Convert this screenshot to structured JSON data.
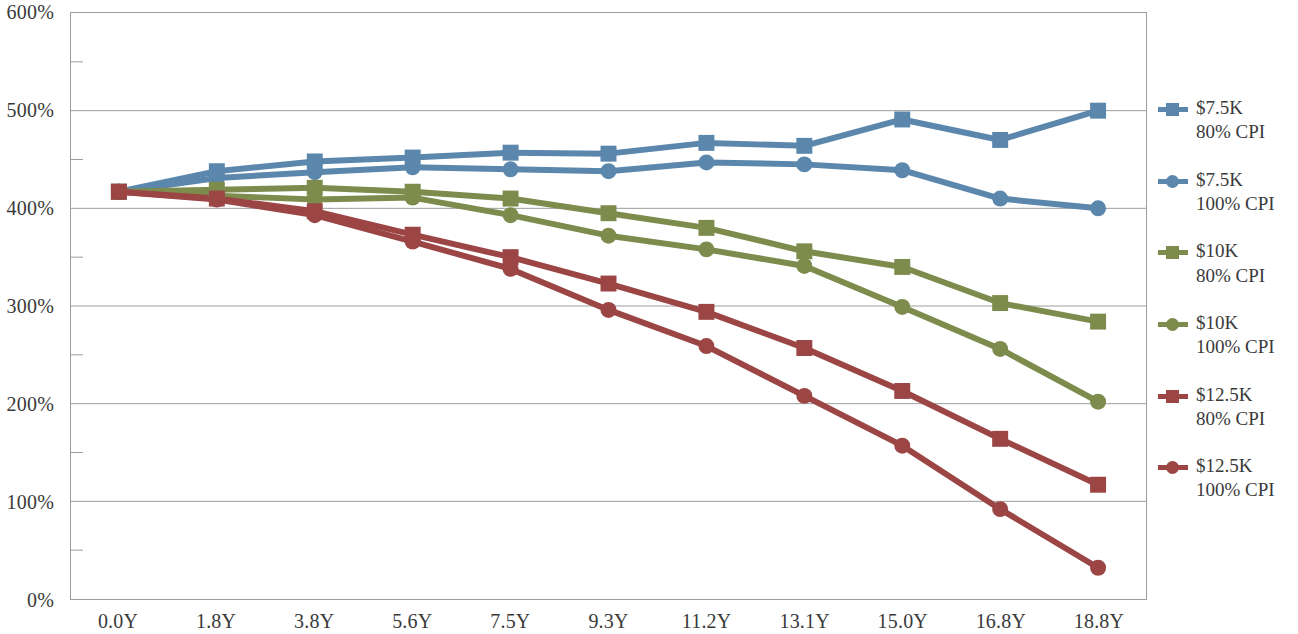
{
  "chart_data": {
    "type": "line",
    "title": "",
    "subtitle": "",
    "xlabel": "",
    "ylabel": "",
    "categories": [
      "0.0Y",
      "1.8Y",
      "3.8Y",
      "5.6Y",
      "7.5Y",
      "9.3Y",
      "11.2Y",
      "13.1Y",
      "15.0Y",
      "16.8Y",
      "18.8Y"
    ],
    "x": [
      0.0,
      1.8,
      3.8,
      5.6,
      7.5,
      9.3,
      11.2,
      13.1,
      15.0,
      16.8,
      18.8
    ],
    "ylim": [
      0,
      600
    ],
    "ytick_labels": [
      "0%",
      "100%",
      "200%",
      "300%",
      "400%",
      "500%",
      "600%"
    ],
    "ytick_values": [
      0,
      100,
      200,
      300,
      400,
      500,
      600
    ],
    "yminor_values": [
      50,
      150,
      250,
      350,
      450,
      550
    ],
    "grid": "horizontal-major",
    "legend_position": "right",
    "value_unit": "%",
    "series": [
      {
        "name": "$7.5K 80% CPI",
        "label_line1": "$7.5K",
        "label_line2": "80% CPI",
        "color": "#5c87ad",
        "marker": "square",
        "values": [
          417,
          438,
          448,
          452,
          457,
          456,
          467,
          464,
          491,
          470,
          500
        ]
      },
      {
        "name": "$7.5K 100% CPI",
        "label_line1": "$7.5K",
        "label_line2": "100% CPI",
        "color": "#5c87ad",
        "marker": "circle",
        "values": [
          417,
          431,
          437,
          442,
          440,
          438,
          447,
          445,
          439,
          410,
          400
        ]
      },
      {
        "name": "$10K 80% CPI",
        "label_line1": "$10K",
        "label_line2": "80% CPI",
        "color": "#7d8c4d",
        "marker": "square",
        "values": [
          417,
          419,
          421,
          417,
          410,
          395,
          380,
          356,
          340,
          303,
          284
        ]
      },
      {
        "name": "$10K 100% CPI",
        "label_line1": "$10K",
        "label_line2": "100% CPI",
        "color": "#7d8c4d",
        "marker": "circle",
        "values": [
          417,
          413,
          409,
          411,
          393,
          372,
          358,
          341,
          299,
          256,
          202
        ]
      },
      {
        "name": "$12.5K 80% CPI",
        "label_line1": "$12.5K",
        "label_line2": "80% CPI",
        "color": "#9c4545",
        "marker": "square",
        "values": [
          417,
          410,
          397,
          373,
          350,
          323,
          294,
          257,
          213,
          164,
          117
        ]
      },
      {
        "name": "$12.5K 100% CPI",
        "label_line1": "$12.5K",
        "label_line2": "100% CPI",
        "color": "#9c4545",
        "marker": "circle",
        "values": [
          417,
          409,
          393,
          366,
          338,
          296,
          259,
          208,
          157,
          92,
          32
        ]
      }
    ]
  },
  "axis": {
    "y_labels": [
      "600%",
      "500%",
      "400%",
      "300%",
      "200%",
      "100%",
      "0%"
    ],
    "x_labels": [
      "0.0Y",
      "1.8Y",
      "3.8Y",
      "5.6Y",
      "7.5Y",
      "9.3Y",
      "11.2Y",
      "13.1Y",
      "15.0Y",
      "16.8Y",
      "18.8Y"
    ]
  },
  "legend": {
    "items": [
      {
        "line1": "$7.5K",
        "line2": "80% CPI",
        "color": "#5c87ad",
        "marker": "square"
      },
      {
        "line1": "$7.5K",
        "line2": "100% CPI",
        "color": "#5c87ad",
        "marker": "circle"
      },
      {
        "line1": "$10K",
        "line2": "80% CPI",
        "color": "#7d8c4d",
        "marker": "square"
      },
      {
        "line1": "$10K",
        "line2": "100% CPI",
        "color": "#7d8c4d",
        "marker": "circle"
      },
      {
        "line1": "$12.5K",
        "line2": "80% CPI",
        "color": "#9c4545",
        "marker": "square"
      },
      {
        "line1": "$12.5K",
        "line2": "100% CPI",
        "color": "#9c4545",
        "marker": "circle"
      }
    ]
  },
  "colors": {
    "blue": "#5c87ad",
    "green": "#7d8c4d",
    "red": "#9c4545",
    "gridline": "#9d9d9d",
    "axis_text": "#3a3a3a",
    "background": "#ffffff"
  }
}
